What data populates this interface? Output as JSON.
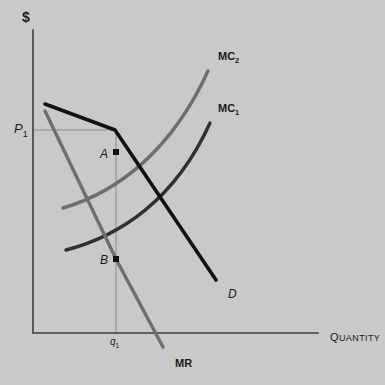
{
  "figure": {
    "background_color": "#c9c9c9",
    "axis_color": "#3c3c3c",
    "curve_dark_color": "#141414",
    "curve_gray_color": "#6e6e6e",
    "label_color": "#1a1a1a"
  },
  "axes": {
    "y_label": "$",
    "x_label_lead": "Q",
    "x_label_rest": "UANTITY",
    "x_label_full": "QUANTITY",
    "origin": {
      "x": 33,
      "y": 333
    },
    "y_top": {
      "x": 33,
      "y": 30
    },
    "x_right": {
      "x": 318,
      "y": 333
    }
  },
  "ticks": {
    "price": {
      "label": "P",
      "subscript": "1",
      "x": 14,
      "y": 122
    },
    "quantity": {
      "label": "q",
      "subscript": "1",
      "x": 110,
      "y": 337
    }
  },
  "guides": {
    "price_line": {
      "x1": 33,
      "y1": 130,
      "x2": 116,
      "y2": 130
    },
    "quantity_line": {
      "x1": 116,
      "y1": 130,
      "x2": 116,
      "y2": 333
    }
  },
  "curves": [
    {
      "name": "demand",
      "label": "D",
      "label_x": 228,
      "label_y": 288,
      "style": "dark",
      "kink": {
        "x": 115,
        "y": 130
      },
      "path": "M 45,104 L 115,130 L 216,280"
    },
    {
      "name": "marginal-revenue",
      "label": "MR",
      "label_x": 175,
      "label_y": 358,
      "style": "dark",
      "path": "M 45,111 L 116,259 L 163,347"
    },
    {
      "name": "marginal-cost-1",
      "label": "MC",
      "label_subscript": "1",
      "label_x": 218,
      "label_y": 103,
      "style": "dark",
      "path": "M 66,250 C 120,236 175,200 210,123"
    },
    {
      "name": "marginal-cost-2",
      "label": "MC",
      "label_subscript": "2",
      "label_x": 218,
      "label_y": 51,
      "style": "gray",
      "path": "M 63,208 C 118,192 172,150 208,71"
    }
  ],
  "points": [
    {
      "name": "point-a",
      "label": "A",
      "x": 116,
      "y": 152,
      "label_x": 100,
      "label_y": 154
    },
    {
      "name": "point-b",
      "label": "B",
      "x": 116,
      "y": 259,
      "label_x": 100,
      "label_y": 261
    }
  ]
}
